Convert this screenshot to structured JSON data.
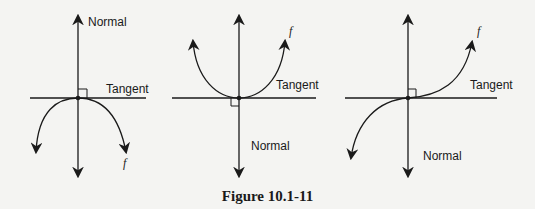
{
  "figure": {
    "caption": "Figure 10.1-11",
    "stroke_color": "#1a1a1a",
    "background": "#f4f4f2"
  },
  "panels": [
    {
      "id": "concave-down-max",
      "curve_shape": "downward parabola (local maximum at origin)",
      "normal_label": "Normal",
      "tangent_label": "Tangent",
      "function_label": "f"
    },
    {
      "id": "concave-up-min",
      "curve_shape": "upward parabola (local minimum at origin)",
      "normal_label": "Normal",
      "tangent_label": "Tangent",
      "function_label": "f"
    },
    {
      "id": "inflection",
      "curve_shape": "cubic (horizontal inflection at origin)",
      "normal_label": "Normal",
      "tangent_label": "Tangent",
      "function_label": "f"
    }
  ]
}
